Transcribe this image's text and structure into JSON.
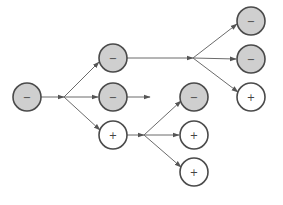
{
  "diagram": {
    "title": "",
    "colors": {
      "negative_fill": "#cfcfcf",
      "positive_fill": "#ffffff",
      "stroke": "#4a4a4a",
      "edge": "#6b6b6b"
    },
    "nodes": [
      {
        "id": "root",
        "sign": "negative",
        "label": "−",
        "x": 27,
        "y": 97
      },
      {
        "id": "a1",
        "sign": "negative",
        "label": "−",
        "x": 113,
        "y": 58
      },
      {
        "id": "a2",
        "sign": "negative",
        "label": "−",
        "x": 113,
        "y": 97
      },
      {
        "id": "a3",
        "sign": "positive",
        "label": "+",
        "x": 113,
        "y": 135
      },
      {
        "id": "b1",
        "sign": "negative",
        "label": "−",
        "x": 251,
        "y": 21
      },
      {
        "id": "b2",
        "sign": "negative",
        "label": "−",
        "x": 251,
        "y": 59
      },
      {
        "id": "b3",
        "sign": "positive",
        "label": "+",
        "x": 251,
        "y": 97
      },
      {
        "id": "c1",
        "sign": "negative",
        "label": "−",
        "x": 194,
        "y": 97
      },
      {
        "id": "c2",
        "sign": "positive",
        "label": "+",
        "x": 194,
        "y": 135
      },
      {
        "id": "c3",
        "sign": "positive",
        "label": "+",
        "x": 194,
        "y": 172
      }
    ],
    "edges": [
      {
        "from": "root",
        "to": "a1"
      },
      {
        "from": "root",
        "to": "a2"
      },
      {
        "from": "root",
        "to": "a3"
      },
      {
        "from": "a1",
        "to": "b1"
      },
      {
        "from": "a1",
        "to": "b2"
      },
      {
        "from": "a1",
        "to": "b3"
      },
      {
        "from": "a2",
        "to": "open-end"
      },
      {
        "from": "a3",
        "to": "c1"
      },
      {
        "from": "a3",
        "to": "c2"
      },
      {
        "from": "a3",
        "to": "c3"
      }
    ]
  }
}
